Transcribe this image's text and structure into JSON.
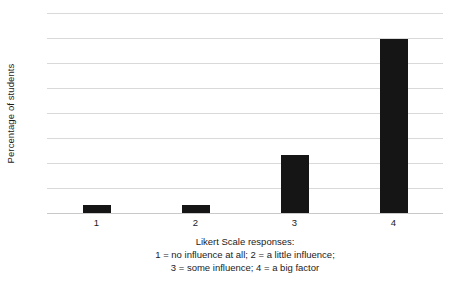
{
  "chart_data": {
    "type": "bar",
    "title": "",
    "subtitle": "",
    "categories": [
      "1",
      "2",
      "3",
      "4"
    ],
    "values": [
      4,
      4,
      29,
      87
    ],
    "series": [
      {
        "name": "Percentage of students",
        "values": [
          4,
          4,
          29,
          87
        ]
      }
    ],
    "xlabel": "Likert Scale responses:",
    "ylabel": "Percentage of students",
    "ylim": [
      0,
      100
    ],
    "xtick_labels": [
      "1",
      "2",
      "3",
      "4"
    ],
    "ytick_labels": [],
    "grid": true,
    "gridline_count": 8,
    "legend": false,
    "legend_position": "none",
    "bar_color": "#151515",
    "grid_color": "#d9d9d9",
    "axis_color": "#c9c9c9",
    "background_color": "#ffffff",
    "annotations": [
      "Likert Scale responses:",
      "1 = no influence at all; 2 = a little influence;",
      "3 = some influence; 4 = a big factor"
    ]
  },
  "axes": {
    "y_title": "Percentage of students",
    "x_ticks": [
      {
        "label": "1"
      },
      {
        "label": "2"
      },
      {
        "label": "3"
      },
      {
        "label": "4"
      }
    ]
  },
  "caption": {
    "line1": "Likert Scale responses:",
    "line2": "1 = no influence at all; 2 = a little influence;",
    "line3": "3 = some influence; 4 = a big factor"
  }
}
